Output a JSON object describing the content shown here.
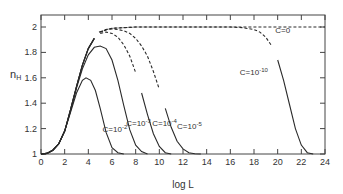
{
  "chart_data": {
    "type": "line",
    "title": "",
    "xlabel": "log L",
    "ylabel": "n_H",
    "xlim": [
      0,
      24
    ],
    "ylim": [
      1,
      2.1
    ],
    "x_ticks": [
      0,
      2,
      4,
      6,
      8,
      10,
      12,
      14,
      16,
      18,
      20,
      22,
      24
    ],
    "y_ticks": [
      1,
      1.2,
      1.4,
      1.6,
      1.8,
      2
    ],
    "y_tick_labels": [
      "1",
      "1.2",
      "1.4",
      "1.6",
      "1.8",
      "2"
    ],
    "grid": false,
    "legend": "inline labels",
    "series": [
      {
        "name": "C=10^-2",
        "label": "C=10",
        "exp": "-2",
        "style": "solid",
        "x": [
          0,
          0.5,
          1,
          1.5,
          2,
          2.5,
          3,
          3.5,
          3.8,
          4.2,
          4.6,
          5,
          5.5,
          6,
          6.5,
          7
        ],
        "y": [
          1,
          1.005,
          1.03,
          1.08,
          1.18,
          1.33,
          1.48,
          1.58,
          1.6,
          1.58,
          1.5,
          1.36,
          1.17,
          1.05,
          1.01,
          1.0
        ]
      },
      {
        "name": "C=10^-3",
        "label": "C=10",
        "exp": "-3",
        "style": "solid",
        "x": [
          0,
          0.5,
          1,
          1.5,
          2,
          2.5,
          3,
          3.5,
          4,
          4.5,
          5,
          5.5,
          6,
          6.5,
          7,
          7.5,
          8,
          8.5,
          9
        ],
        "y": [
          1,
          1.005,
          1.03,
          1.08,
          1.18,
          1.34,
          1.52,
          1.67,
          1.78,
          1.84,
          1.85,
          1.83,
          1.74,
          1.58,
          1.38,
          1.19,
          1.07,
          1.02,
          1.0
        ]
      },
      {
        "name": "C=10^-4",
        "label": "C=10",
        "exp": "-4",
        "style": "mixed",
        "x": [
          0,
          0.5,
          1,
          1.5,
          2,
          2.5,
          3,
          3.5,
          4,
          4.5,
          5,
          5.5,
          6,
          6.5,
          7,
          7.5,
          8,
          8.5,
          9,
          9.5,
          10,
          10.5,
          11
        ],
        "y": [
          1,
          1.005,
          1.03,
          1.08,
          1.18,
          1.35,
          1.53,
          1.7,
          1.83,
          1.91,
          1.95,
          1.96,
          1.95,
          1.92,
          1.86,
          1.77,
          1.64,
          1.48,
          1.31,
          1.16,
          1.06,
          1.01,
          1.0
        ],
        "dashed_from": 4.9,
        "dashed_to": 8.2
      },
      {
        "name": "C=10^-5",
        "label": "C=10",
        "exp": "-5",
        "style": "mixed",
        "x": [
          0,
          0.5,
          1,
          1.5,
          2,
          2.5,
          3,
          3.5,
          4,
          4.5,
          5,
          5.5,
          6,
          6.5,
          7,
          7.5,
          8,
          8.5,
          9,
          9.5,
          10,
          10.5,
          11,
          11.5,
          12,
          12.5,
          13,
          13.5
        ],
        "y": [
          1,
          1.005,
          1.03,
          1.08,
          1.18,
          1.35,
          1.53,
          1.7,
          1.83,
          1.91,
          1.96,
          1.98,
          1.985,
          1.98,
          1.97,
          1.95,
          1.91,
          1.85,
          1.77,
          1.65,
          1.51,
          1.36,
          1.21,
          1.1,
          1.04,
          1.01,
          1.002,
          1.0
        ],
        "dashed_from": 4.9,
        "dashed_to": 10.2
      },
      {
        "name": "C=10^-10",
        "label": "C=10",
        "exp": "-10",
        "style": "mixed",
        "x": [
          0,
          0.5,
          1,
          1.5,
          2,
          2.5,
          3,
          3.5,
          4,
          4.5,
          5,
          5.5,
          6,
          8,
          10,
          12,
          14,
          16,
          17,
          18,
          18.5,
          19,
          19.5,
          20,
          20.5,
          21,
          21.5,
          22,
          22.5,
          23
        ],
        "y": [
          1,
          1.005,
          1.03,
          1.08,
          1.18,
          1.35,
          1.53,
          1.7,
          1.83,
          1.91,
          1.96,
          1.98,
          1.99,
          2.0,
          2.0,
          2.0,
          2.0,
          2.0,
          1.995,
          1.98,
          1.96,
          1.92,
          1.85,
          1.74,
          1.58,
          1.39,
          1.2,
          1.07,
          1.01,
          1.0
        ],
        "dashed_from": 4.9,
        "dashed_to": 19.8
      },
      {
        "name": "C=0",
        "label": "C=0",
        "exp": "",
        "style": "dashed",
        "x": [
          4.9,
          6,
          8,
          10,
          12,
          14,
          16,
          18,
          20,
          22,
          24
        ],
        "y": [
          1.96,
          1.99,
          2.0,
          2.0,
          2.0,
          2.0,
          2.0,
          2.0,
          2.0,
          2.0,
          2.0
        ]
      }
    ],
    "annotations": [
      {
        "text": "C=10^-2",
        "x": 5.2,
        "y": 1.17
      },
      {
        "text": "C=10^-3",
        "x": 7.2,
        "y": 1.22
      },
      {
        "text": "C=10^-4",
        "x": 9.4,
        "y": 1.22
      },
      {
        "text": "C=10^-5",
        "x": 11.5,
        "y": 1.2
      },
      {
        "text": "C=10^-10",
        "x": 16.8,
        "y": 1.62
      },
      {
        "text": "C=0",
        "x": 19.8,
        "y": 1.95
      }
    ]
  }
}
